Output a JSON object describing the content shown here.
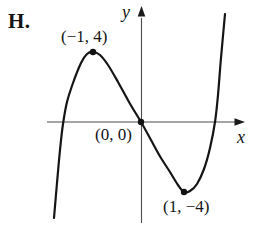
{
  "figure": {
    "label": "H.",
    "axis_labels": {
      "x": "x",
      "y": "y"
    },
    "points": [
      {
        "label": "(−1, 4)",
        "x": -1,
        "y": 4,
        "role": "local maximum"
      },
      {
        "label": "(0, 0)",
        "x": 0,
        "y": 0,
        "role": "origin / inflection point"
      },
      {
        "label": "(1, −4)",
        "x": 1,
        "y": -4,
        "role": "local minimum"
      }
    ]
  },
  "chart_data": {
    "type": "line",
    "title": "H.",
    "xlabel": "x",
    "ylabel": "y",
    "grid": false,
    "legend": false,
    "series": [
      {
        "name": "cubic-curve",
        "description": "Cubic-shaped curve rising steeply from lower left, local maximum at (-1, 4), passing through the origin (0, 0), local minimum at (1, -4), then rising steeply to upper right",
        "labeled_points": [
          [
            -1,
            4
          ],
          [
            0,
            0
          ],
          [
            1,
            -4
          ]
        ],
        "x_intercepts_approx": [
          -1.7,
          0,
          1.7
        ]
      }
    ],
    "annotations": [
      "(−1, 4)",
      "(0, 0)",
      "(1, −4)"
    ],
    "render": {
      "width": 253,
      "height": 241,
      "x_axis": {
        "y": 122,
        "x1": 47,
        "x2": 236,
        "tip_x": 245
      },
      "y_axis": {
        "x": 141.5,
        "y1": 223,
        "y2": 18,
        "tip_y": 6
      },
      "curve_points": [
        [
          54,
          218
        ],
        [
          57,
          183
        ],
        [
          60,
          150
        ],
        [
          63,
          124
        ],
        [
          67,
          102
        ],
        [
          73,
          83
        ],
        [
          81,
          63
        ],
        [
          87,
          54
        ],
        [
          93,
          52
        ],
        [
          100,
          55
        ],
        [
          108,
          65
        ],
        [
          118,
          82
        ],
        [
          129,
          102
        ],
        [
          141,
          122
        ],
        [
          151,
          140
        ],
        [
          161,
          158
        ],
        [
          170,
          172
        ],
        [
          178,
          185
        ],
        [
          184,
          192
        ],
        [
          190,
          191
        ],
        [
          197,
          184
        ],
        [
          204,
          169
        ],
        [
          210,
          148
        ],
        [
          215,
          122
        ],
        [
          218,
          95
        ],
        [
          221,
          58
        ],
        [
          225,
          14
        ]
      ],
      "markers": [
        [
          93,
          52
        ],
        [
          141,
          122
        ],
        [
          184,
          192
        ]
      ],
      "marker_radius": 3.2,
      "colors": {
        "curve": "#151515",
        "axis": "#4d4d4d",
        "arrow": "#1a1a1a",
        "marker": "#111111",
        "text": "#151515",
        "background": "#ffffff"
      }
    }
  }
}
